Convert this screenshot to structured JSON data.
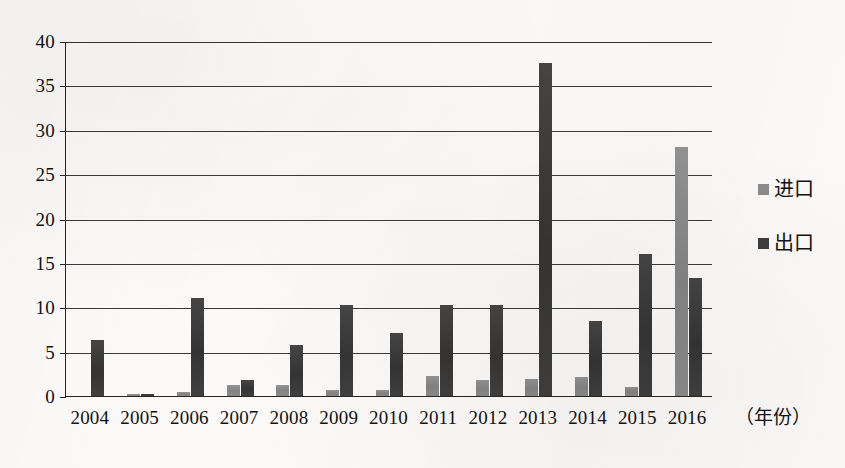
{
  "chart_data": {
    "type": "bar",
    "title": "",
    "xlabel": "（年份）",
    "ylabel": "",
    "categories": [
      "2004",
      "2005",
      "2006",
      "2007",
      "2008",
      "2009",
      "2010",
      "2011",
      "2012",
      "2013",
      "2014",
      "2015",
      "2016"
    ],
    "series": [
      {
        "name": "进口",
        "color": "#8c8c8c",
        "values": [
          0.0,
          0.2,
          0.5,
          1.2,
          1.2,
          0.7,
          0.7,
          2.3,
          1.8,
          1.9,
          2.1,
          1.0,
          28.1
        ]
      },
      {
        "name": "出口",
        "color": "#3d3d3d",
        "values": [
          6.3,
          0.2,
          11.0,
          1.8,
          5.7,
          10.2,
          7.1,
          10.2,
          10.2,
          37.5,
          8.5,
          16.0,
          13.3
        ]
      }
    ],
    "ylim": [
      0,
      40
    ],
    "yticks": [
      0,
      5,
      10,
      15,
      20,
      25,
      30,
      35,
      40
    ],
    "ytick_labels": [
      "0",
      "5",
      "10",
      "15",
      "20",
      "25",
      "30",
      "35",
      "40"
    ],
    "grid": true,
    "legend_position": "right"
  },
  "legend": {
    "entries": [
      {
        "label": "进口"
      },
      {
        "label": "出口"
      }
    ]
  }
}
